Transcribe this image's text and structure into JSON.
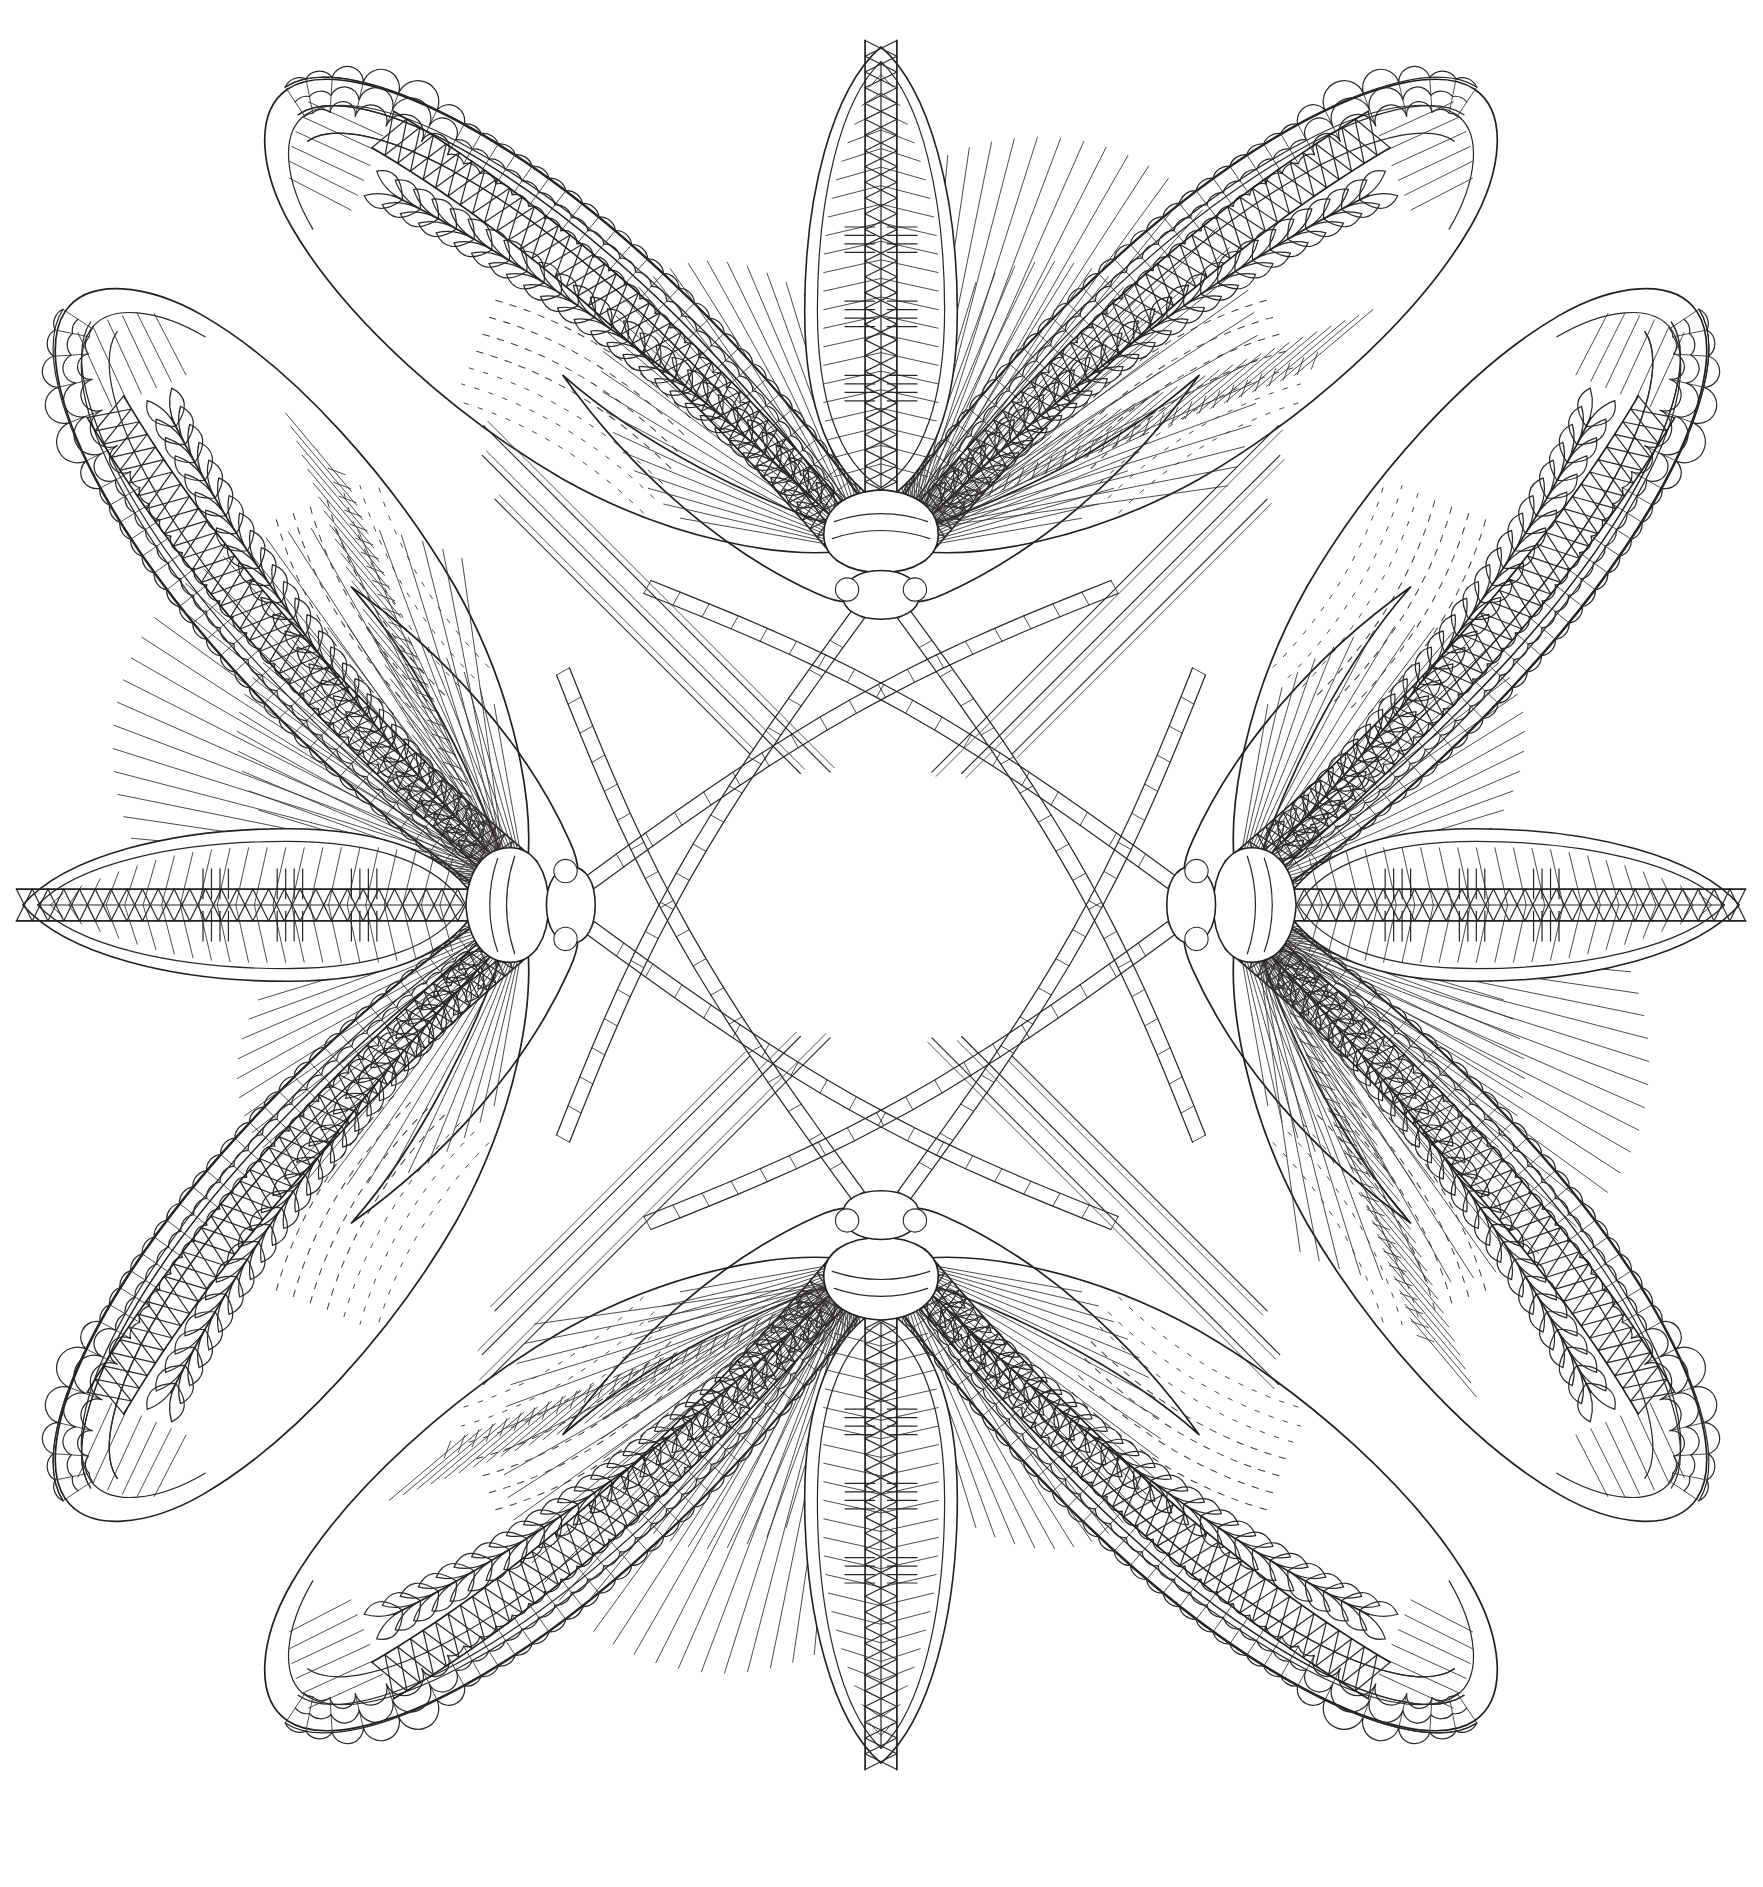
{
  "artwork": {
    "title": "Four-Fold Moth Mandala",
    "medium": "black ink line art on white paper",
    "style": "coloring-book / zentangle line drawing",
    "background_color": "#ffffff",
    "ink_color": "#22201f",
    "canvas": {
      "width": 1763,
      "height": 1887
    },
    "symmetry": {
      "type": "4-fold rotational",
      "order": 4,
      "center_x": 881,
      "center_y": 905
    },
    "subject_count": 4,
    "subject_name": "stylized moth",
    "arrangement": "four moths radiating from a shared center, heads inward, wings outward forming a quatrefoil cross",
    "orientations_deg": [
      0,
      90,
      180,
      270
    ],
    "motifs": [
      "scalloped shingle wing margin",
      "braided rope wing edge",
      "twisted cord body outline",
      "wheat / laurel leaf chain vein",
      "radiating fan of fine lines",
      "dashed contour shading",
      "chevron herringbone fill",
      "segmented beaded antennae"
    ],
    "moths": [
      {
        "id": "moth-top",
        "label": "Top moth",
        "rotation_deg": 0,
        "body_axis": "vertical, head down toward center"
      },
      {
        "id": "moth-right",
        "label": "Right moth",
        "rotation_deg": 90,
        "body_axis": "horizontal, head left toward center"
      },
      {
        "id": "moth-bottom",
        "label": "Bottom moth",
        "rotation_deg": 180,
        "body_axis": "vertical, head up toward center"
      },
      {
        "id": "moth-left",
        "label": "Left moth",
        "rotation_deg": 270,
        "body_axis": "horizontal, head right toward center"
      }
    ],
    "moth_parts": [
      {
        "part": "forewing-left",
        "label": "Left forewing"
      },
      {
        "part": "forewing-right",
        "label": "Right forewing"
      },
      {
        "part": "hindwing-left",
        "label": "Left hindwing"
      },
      {
        "part": "hindwing-right",
        "label": "Right hindwing"
      },
      {
        "part": "thorax",
        "label": "Thorax"
      },
      {
        "part": "abdomen",
        "label": "Abdomen"
      },
      {
        "part": "head",
        "label": "Head"
      },
      {
        "part": "antenna-left",
        "label": "Left antenna"
      },
      {
        "part": "antenna-right",
        "label": "Right antenna"
      }
    ],
    "center_motif": {
      "label": "Crossed antennae knot",
      "description": "the eight beaded antennae of the four moths cross at the centre forming a small woven diamond"
    },
    "counts": {
      "wing_margin_scallops_per_wing": 34,
      "rope_twists_per_edge": 46,
      "leaf_chain_links_per_vein": 28,
      "fan_rays_per_wing": 26,
      "antenna_segments": 18,
      "abdomen_stripe_groups": 3
    }
  }
}
